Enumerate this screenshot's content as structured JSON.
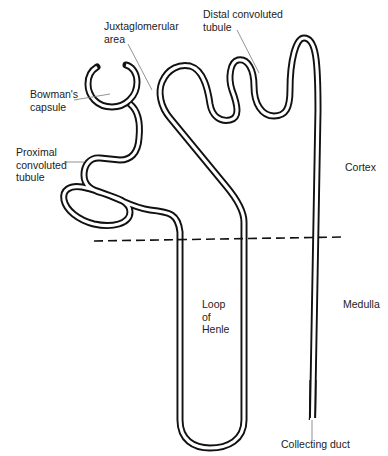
{
  "diagram": {
    "labels": {
      "juxtaglomerular": "Juxtaglomerular\narea",
      "distal": "Distal convoluted\ntubule",
      "bowmans": "Bowman's\ncapsule",
      "proximal": "Proximal\nconvoluted\ntubule",
      "cortex": "Cortex",
      "medulla": "Medulla",
      "loop": "Loop\nof\nHenle",
      "collecting": "Collecting duct"
    },
    "regions": [
      "Cortex",
      "Medulla"
    ],
    "colors": {
      "stroke": "#111111",
      "leader": "#777777",
      "background": "#ffffff"
    }
  }
}
